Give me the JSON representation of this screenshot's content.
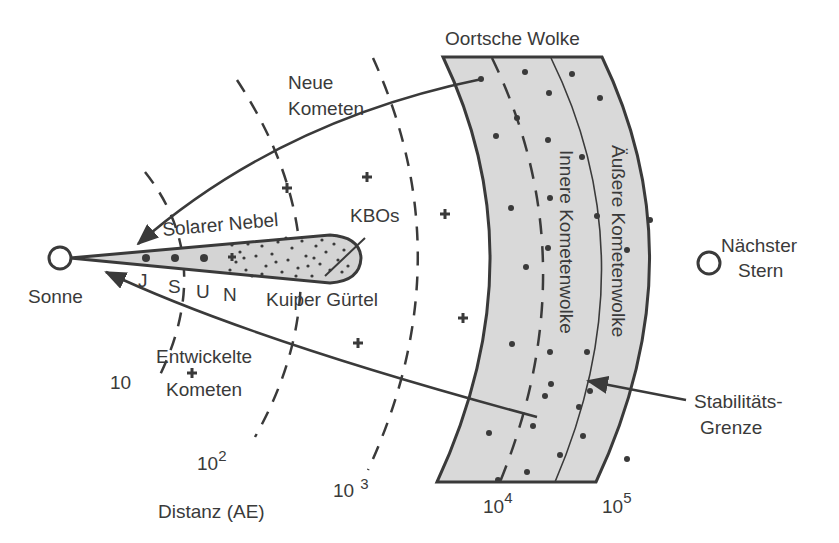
{
  "labels": {
    "oort_cloud": "Oortsche Wolke",
    "new_comets_line1": "Neue",
    "new_comets_line2": "Kometen",
    "solar_nebula": "Solarer Nebel",
    "kbos": "KBOs",
    "kuiper_belt": "Kuiper Gürtel",
    "sun": "Sonne",
    "nearest_star_line1": "Nächster",
    "nearest_star_line2": "Stern",
    "inner_comet_cloud": "Innere Kometenwolke",
    "outer_comet_cloud": "Äußere Kometenwolke",
    "stability_line1": "Stabilitäts-",
    "stability_line2": "Grenze",
    "evolved_comets_line1": "Entwickelte",
    "evolved_comets_line2": "Kometen",
    "distance_axis": "Distanz  (AE)"
  },
  "planets": [
    "J",
    "S",
    "U",
    "N"
  ],
  "distance_ticks": [
    {
      "base": "10",
      "exp": ""
    },
    {
      "base": "10",
      "exp": "2"
    },
    {
      "base": "10",
      "exp": "3"
    },
    {
      "base": "10",
      "exp": "4"
    },
    {
      "base": "10",
      "exp": "5"
    }
  ],
  "colors": {
    "ink": "#3a3a3a",
    "cloud_fill": "#d9d9d9",
    "disk_fill": "#d4d4d4"
  }
}
